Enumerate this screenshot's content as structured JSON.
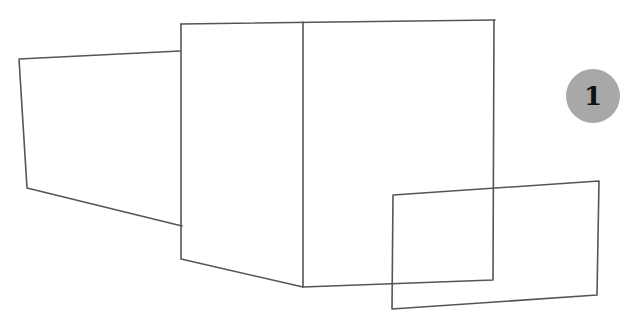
{
  "figure": {
    "width": 623,
    "height": 318,
    "stroke_color": "#555555",
    "background": "#ffffff"
  },
  "step_badge": {
    "label": "1",
    "color": "#a8a8a8",
    "center": [
      593,
      96
    ],
    "radius": 27
  },
  "shapes": {
    "left_panel": "M180,51 L19,59 L27,188 L182,226",
    "front_face": "M181,24 L181,259 L303,287 L303,22",
    "top_edge": "M181,24 L495,20",
    "right_face": "M303,287 L493,280 L494,20",
    "small_rect": "M393,195 L599,181 L597,295 L392,309 Z"
  }
}
